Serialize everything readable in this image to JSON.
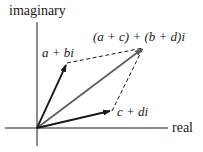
{
  "diagram": {
    "axes": {
      "vertical_label": "imaginary",
      "horizontal_label": "real"
    },
    "vectors": [
      {
        "id": "z1",
        "label": "a + bi",
        "style": "solid-dark"
      },
      {
        "id": "z2",
        "label": "c + di",
        "style": "solid-dark"
      },
      {
        "id": "sum",
        "label": "(a + c) + (b + d)i",
        "style": "solid-gray"
      }
    ],
    "edges": [
      {
        "from": "z1",
        "to": "sum",
        "style": "dashed"
      },
      {
        "from": "z2",
        "to": "sum",
        "style": "dashed"
      }
    ],
    "colors": {
      "dark": "#1a1a1a",
      "gray": "#5a5a5a",
      "background": "#ffffff"
    }
  }
}
